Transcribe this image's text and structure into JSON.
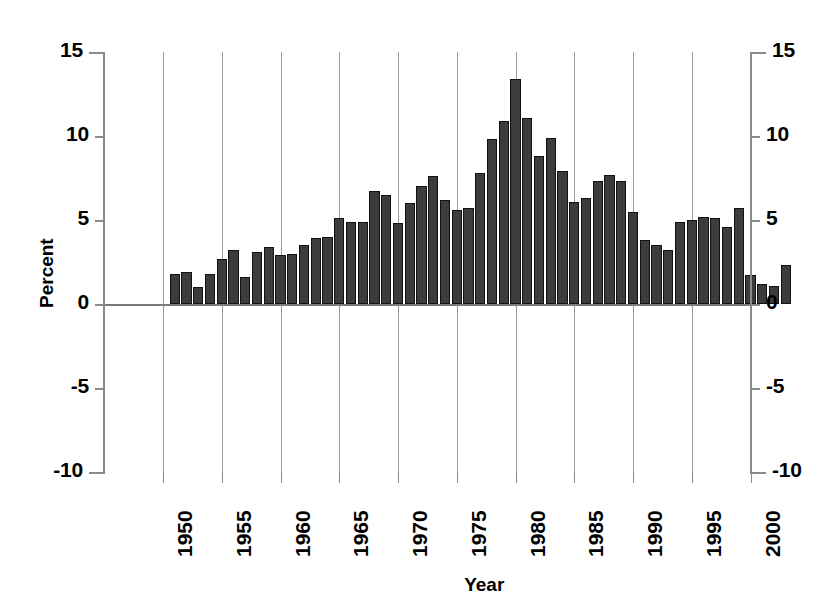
{
  "chart_data": {
    "type": "bar",
    "title": "",
    "subtitle": "",
    "xlabel": "Year",
    "ylabel": "Percent",
    "ylim": [
      -10,
      15
    ],
    "yticks": [
      15,
      10,
      5,
      0,
      -5,
      -10
    ],
    "ytick_labels": [
      "15",
      "10",
      "5",
      "0",
      "-5",
      "-10"
    ],
    "xlim": [
      1950.2,
      1903.8
    ],
    "xticks": [
      1950,
      1955,
      1960,
      1965,
      1970,
      1975,
      1980,
      1985,
      1990,
      1995,
      2000
    ],
    "xtick_labels": [
      "1950",
      "1955",
      "1960",
      "1965",
      "1970",
      "1975",
      "1980",
      "1985",
      "1990",
      "1995",
      "2000"
    ],
    "grid": "vertical-only",
    "legend": "none",
    "dual_y_axis": true,
    "bar_color": "#3c3c3c",
    "bar_edge_color": "#111111",
    "grid_color": "#9a9a9a",
    "axis_color": "#8a8a8a",
    "x": [
      1951,
      1952,
      1953,
      1954,
      1955,
      1956,
      1957,
      1958,
      1959,
      1960,
      1961,
      1962,
      1963,
      1964,
      1965,
      1966,
      1967,
      1968,
      1969,
      1970,
      1971,
      1972,
      1973,
      1974,
      1975,
      1976,
      1977,
      1978,
      1979,
      1980,
      1981,
      1982,
      1983,
      1984,
      1985,
      1986,
      1987,
      1988,
      1989,
      1990,
      1991,
      1992,
      1993,
      1994,
      1995,
      1996,
      1997,
      1998,
      1999,
      2000,
      2001,
      2002,
      2003
    ],
    "categories": [
      "1951",
      "1952",
      "1953",
      "1954",
      "1955",
      "1956",
      "1957",
      "1958",
      "1959",
      "1960",
      "1961",
      "1962",
      "1963",
      "1964",
      "1965",
      "1966",
      "1967",
      "1968",
      "1969",
      "1970",
      "1971",
      "1972",
      "1973",
      "1974",
      "1975",
      "1976",
      "1977",
      "1978",
      "1979",
      "1980",
      "1981",
      "1982",
      "1983",
      "1984",
      "1985",
      "1986",
      "1987",
      "1988",
      "1989",
      "1990",
      "1991",
      "1992",
      "1993",
      "1994",
      "1995",
      "1996",
      "1997",
      "1998",
      "1999",
      "2000",
      "2001",
      "2002",
      "2003"
    ],
    "values": [
      1.8,
      1.9,
      1.0,
      1.8,
      2.7,
      3.2,
      1.6,
      3.1,
      3.4,
      2.9,
      3.0,
      3.5,
      3.9,
      4.0,
      5.1,
      4.9,
      4.9,
      6.7,
      6.5,
      4.8,
      6.0,
      7.0,
      7.6,
      6.2,
      5.6,
      5.7,
      7.8,
      9.8,
      10.9,
      13.4,
      11.1,
      8.8,
      9.9,
      7.9,
      6.1,
      6.3,
      7.3,
      7.7,
      7.3,
      5.5,
      3.8,
      3.5,
      3.2,
      4.9,
      5.0,
      5.2,
      5.1,
      4.6,
      5.7,
      1.7,
      1.2,
      1.1,
      2.3
    ]
  },
  "axis": {
    "y_left_title": "Percent",
    "y_right_title": "",
    "x_title": "Year"
  }
}
